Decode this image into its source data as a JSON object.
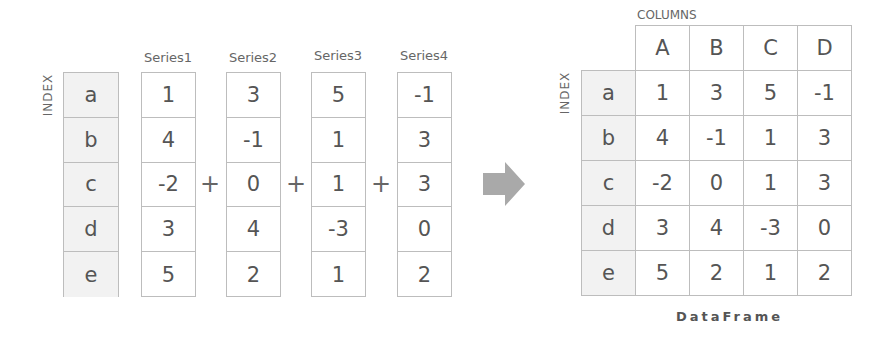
{
  "left": {
    "index_label": "INDEX",
    "index": [
      "a",
      "b",
      "c",
      "d",
      "e"
    ],
    "series": [
      {
        "name": "Series1",
        "values": [
          "1",
          "4",
          "-2",
          "3",
          "5"
        ]
      },
      {
        "name": "Series2",
        "values": [
          "3",
          "-1",
          "0",
          "4",
          "2"
        ]
      },
      {
        "name": "Series3",
        "values": [
          "5",
          "1",
          "1",
          "-3",
          "1"
        ]
      },
      {
        "name": "Series4",
        "values": [
          "-1",
          "3",
          "3",
          "0",
          "2"
        ]
      }
    ],
    "operator": "+"
  },
  "arrow": {
    "icon": "right-arrow-icon",
    "color": "#a9a9a9"
  },
  "right": {
    "columns_label": "COLUMNS",
    "index_label": "INDEX",
    "columns": [
      "A",
      "B",
      "C",
      "D"
    ],
    "rows": [
      {
        "index": "a",
        "values": [
          "1",
          "3",
          "5",
          "-1"
        ]
      },
      {
        "index": "b",
        "values": [
          "4",
          "-1",
          "1",
          "3"
        ]
      },
      {
        "index": "c",
        "values": [
          "-2",
          "0",
          "1",
          "3"
        ]
      },
      {
        "index": "d",
        "values": [
          "3",
          "4",
          "-3",
          "0"
        ]
      },
      {
        "index": "e",
        "values": [
          "5",
          "2",
          "1",
          "2"
        ]
      }
    ],
    "title": "DataFrame"
  },
  "colors": {
    "border": "#bdbdbd",
    "index_fill": "#f2f2f2",
    "text": "#555555"
  }
}
